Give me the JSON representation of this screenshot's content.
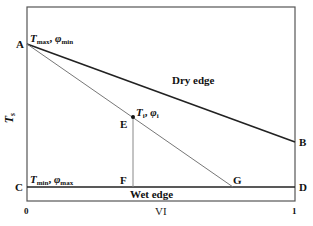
{
  "diagram": {
    "axes": {
      "ylabel": "T",
      "ylabel_sub": "s",
      "xlabel": "VI",
      "x_tick_left": "0",
      "x_tick_right": "1"
    },
    "points": {
      "A": "A",
      "B": "B",
      "C": "C",
      "D": "D",
      "E": "E",
      "F": "F",
      "G": "G"
    },
    "annotations": {
      "top_left": {
        "T": "T",
        "T_sub": "max",
        "sep": ", ",
        "phi": "φ",
        "phi_sub": "min"
      },
      "bottom_left": {
        "T": "T",
        "T_sub": "min",
        "sep": ", ",
        "phi": "φ",
        "phi_sub": "max"
      },
      "point_e": {
        "T": "T",
        "T_sub": "i",
        "sep": ", ",
        "phi": "φ",
        "phi_sub": "i"
      }
    },
    "edges": {
      "dry": "Dry edge",
      "wet": "Wet edge"
    },
    "colors": {
      "frame": "#555555",
      "dry_edge": "#222222",
      "wet_edge": "#222222",
      "iso_line": "#777777",
      "vertical": "#888888"
    }
  }
}
